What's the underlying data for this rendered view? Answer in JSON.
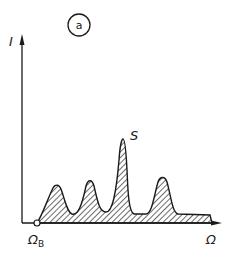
{
  "figure": {
    "panel_label": "a",
    "y_axis_label": "I",
    "x_axis_label": "Ω",
    "origin_marker_label": "Ω",
    "origin_marker_subscript": "B",
    "peak_label": "S"
  },
  "colors": {
    "ink": "#1a1a1a",
    "background": "#ffffff"
  },
  "peaks": [
    {
      "name": "peak-1",
      "x": 57,
      "top_y": 185
    },
    {
      "name": "peak-2",
      "x": 90,
      "top_y": 180
    },
    {
      "name": "peak-S",
      "x": 123,
      "top_y": 140
    },
    {
      "name": "peak-4",
      "x": 163,
      "top_y": 177
    }
  ]
}
